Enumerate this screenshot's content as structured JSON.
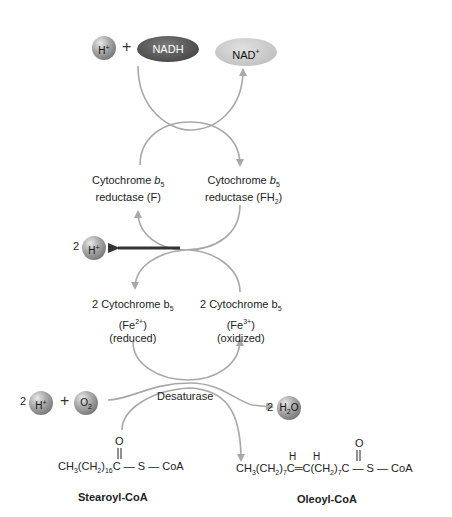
{
  "top": {
    "h_plus": "H",
    "h_plus_sup": "+",
    "plus": "+",
    "nadh": "NADH",
    "nad": "NAD",
    "nad_sup": "+"
  },
  "reductase": {
    "left_line1": "Cytochrome ",
    "left_b": "b",
    "left_sub": "5",
    "left_line2": "reductase (F)",
    "right_line1": "Cytochrome ",
    "right_b": "b",
    "right_sub": "5",
    "right_line2a": "reductase (FH",
    "right_line2_sub": "2",
    "right_line2b": ")"
  },
  "proton_out": {
    "coef": "2",
    "label": "H",
    "sup": "+"
  },
  "cytochrome": {
    "left_line1": "2 Cytochrome b",
    "left_sub": "5",
    "left_line2a": "(Fe",
    "left_line2_sup": "2+",
    "left_line2b": ")",
    "left_line3": "(reduced)",
    "right_line1": "2 Cytochrome b",
    "right_sub": "5",
    "right_line2a": "(Fe",
    "right_line2_sup": "3+",
    "right_line2b": ")",
    "right_line3": "(oxidized)"
  },
  "desaturase": {
    "label": "Desaturase",
    "h_coef": "2",
    "h_label": "H",
    "h_sup": "+",
    "plus": "+",
    "o2_label": "O",
    "o2_sub": "2",
    "water_coef": "2",
    "water_h": "H",
    "water_sub": "2",
    "water_o": "O"
  },
  "stearoyl": {
    "formula_a": "CH",
    "formula_sub1": "3",
    "formula_b": "(CH",
    "formula_sub2": "2",
    "formula_c": ")",
    "formula_sub3": "16",
    "formula_d": "C — S — CoA",
    "carbonyl_o": "O",
    "name": "Stearoyl-CoA"
  },
  "oleoyl": {
    "formula_a": "CH",
    "formula_sub1": "3",
    "formula_b": "(CH",
    "formula_sub2": "2",
    "formula_c": ")",
    "formula_sub3": "7",
    "formula_d": "C═C(CH",
    "formula_sub4": "2",
    "formula_e": ")",
    "formula_sub5": "7",
    "formula_f": "C — S — CoA",
    "h1": "H",
    "h2": "H",
    "carbonyl_o": "O",
    "name": "Oleoyl-CoA"
  },
  "colors": {
    "arrow_gray": "#a8a8a8",
    "arrow_dark": "#333333",
    "nadh_fill": "#4d4d4d",
    "nad_fill": "#c4c4c4"
  }
}
